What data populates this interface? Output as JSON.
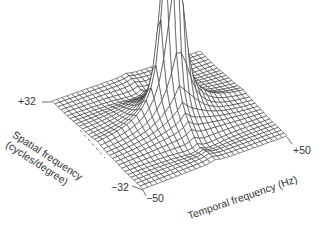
{
  "chart_data": {
    "type": "surface3d",
    "title": "",
    "x_axis": {
      "label": "Temporal frequency (Hz)",
      "range": [
        -50,
        50
      ],
      "tick_labels": [
        "-50",
        "+50"
      ]
    },
    "y_axis": {
      "label_line1": "Spatial frequency",
      "label_line2": "(cycles/degree)",
      "range": [
        -32,
        32
      ],
      "tick_labels": [
        "+32",
        "-32"
      ]
    },
    "z_axis": {
      "label": "",
      "ticks": false
    },
    "grid": false,
    "legend": "none",
    "mesh": {
      "rows": 30,
      "cols": 30,
      "line_color": "#2a2a2a"
    },
    "surface": {
      "description": "Spatiotemporal sensitivity surface: sharp twin-peaked ridge at the origin, flat plateau elsewhere with dark valleys at low spatial frequency",
      "peaks": [
        {
          "temporal_hz": -2,
          "spatial_cpd": 1,
          "relative_height": 1.0
        },
        {
          "temporal_hz": 4,
          "spatial_cpd": -1,
          "relative_height": 0.86
        }
      ],
      "baseline": 0.05
    }
  },
  "labels": {
    "spatial_max": "+32",
    "spatial_min": "−32",
    "temporal_min": "−50",
    "temporal_max": "+50",
    "temporal_axis": "Temporal frequency (Hz)",
    "spatial_axis_1": "Spatial frequency",
    "spatial_axis_2": "(cycles/degree)"
  }
}
